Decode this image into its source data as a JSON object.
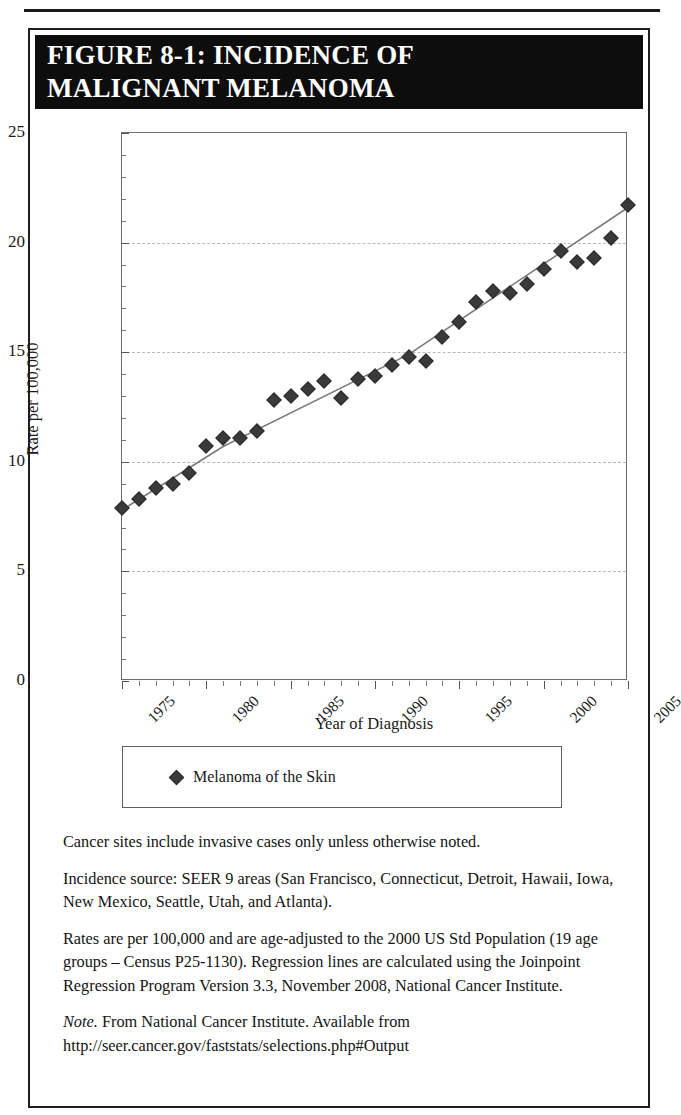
{
  "figure": {
    "title_line1": "FIGURE 8-1: INCIDENCE OF",
    "title_line2": "MALIGNANT MELANOMA"
  },
  "legend": {
    "marker_icon": "diamond-marker-icon",
    "label": "Melanoma of the Skin"
  },
  "notes": [
    "Cancer sites include invasive cases only unless otherwise noted.",
    "Incidence source: SEER 9 areas (San Francisco, Connecticut, Detroit, Hawaii, Iowa, New Mexico, Seattle, Utah, and Atlanta).",
    "Rates are per 100,000 and are age-adjusted to the 2000 US Std Population (19 age groups – Census P25-1130). Regression lines are calculated using the Joinpoint Regression Program Version 3.3, November 2008, National Cancer Institute."
  ],
  "source_note": {
    "italic_prefix": "Note.",
    "text": " From National Cancer Institute. Available from http://seer.cancer.gov/faststats/selections.php#Output"
  },
  "chart_data": {
    "type": "scatter",
    "title": "FIGURE 8-1: INCIDENCE OF MALIGNANT MELANOMA",
    "xlabel": "Year of Diagnosis",
    "ylabel": "Rate per 100,000",
    "xlim": [
      1975,
      2005
    ],
    "ylim": [
      0,
      25
    ],
    "ytick_labels": [
      "0",
      "5",
      "10",
      "15",
      "20",
      "25"
    ],
    "yticks": [
      0,
      5,
      10,
      15,
      20,
      25
    ],
    "xtick_labels": [
      "1975",
      "1980",
      "1985",
      "1990",
      "1995",
      "2000",
      "2005"
    ],
    "xticks": [
      1975,
      1980,
      1985,
      1990,
      1995,
      2000,
      2005
    ],
    "x_minor_step": 1,
    "grid": "horizontal-dashed",
    "legend_position": "below-plot",
    "marker_color": "#3a3a3a",
    "trend_color": "#7a7a7a",
    "series": [
      {
        "name": "Melanoma of the Skin",
        "x": [
          1975,
          1976,
          1977,
          1978,
          1979,
          1980,
          1981,
          1982,
          1983,
          1984,
          1985,
          1986,
          1987,
          1988,
          1989,
          1990,
          1991,
          1992,
          1993,
          1994,
          1995,
          1996,
          1997,
          1998,
          1999,
          2000,
          2001,
          2002,
          2003,
          2004,
          2005
        ],
        "values": [
          7.9,
          8.3,
          8.8,
          9.0,
          9.5,
          10.7,
          11.1,
          11.1,
          11.4,
          12.8,
          13.0,
          13.3,
          13.7,
          12.9,
          13.8,
          13.9,
          14.4,
          14.8,
          14.6,
          15.7,
          16.4,
          17.3,
          17.8,
          17.7,
          18.1,
          18.8,
          19.6,
          19.1,
          19.3,
          20.2,
          21.7
        ],
        "trend": [
          {
            "x": 1975,
            "y": 7.8
          },
          {
            "x": 1981,
            "y": 10.7
          },
          {
            "x": 1992,
            "y": 14.9
          },
          {
            "x": 2005,
            "y": 21.6
          }
        ]
      }
    ]
  }
}
